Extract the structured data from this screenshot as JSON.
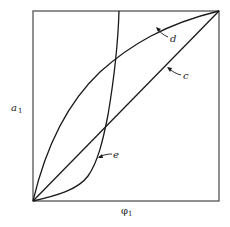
{
  "diagram": {
    "axes": {
      "x_label": "φ",
      "x_label_subscript": "1",
      "y_label": "a",
      "y_label_subscript": "1"
    },
    "curves": [
      {
        "id": "c",
        "label": "c",
        "shape": "straight diagonal line from origin to top-right corner"
      },
      {
        "id": "d",
        "label": "d",
        "shape": "concave curve above diagonal from origin to top-right corner"
      },
      {
        "id": "e",
        "label": "e",
        "shape": "sigmoidal curve from origin rising steeply to top edge"
      }
    ],
    "colors": {
      "line": "#1a1a1a",
      "frame": "#555555",
      "background": "#ffffff"
    }
  }
}
